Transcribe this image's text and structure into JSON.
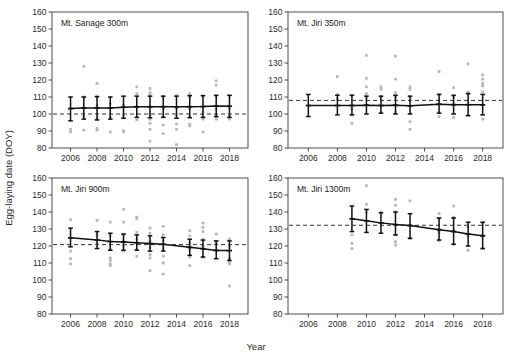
{
  "figure": {
    "xlabel": "Year",
    "ylabel": "Egg-laying date (DOY)"
  },
  "chart_data": {
    "type": "scatter",
    "title": "",
    "xlabel": "Year",
    "ylabel": "Egg-laying date (DOY)",
    "xlim": [
      2004.6,
      2019.4
    ],
    "ylim": [
      80,
      160
    ],
    "xticks": [
      2006,
      2008,
      2010,
      2012,
      2014,
      2016,
      2018
    ],
    "yticks": [
      80,
      90,
      100,
      110,
      120,
      130,
      140,
      150,
      160
    ],
    "grid": false,
    "legend": "none",
    "panel_layout": "2x2",
    "panels": [
      {
        "id": "mt-sanage-300m",
        "label": "Mt. Sanage  300m",
        "row": 0,
        "col": 0,
        "reference_line": 100.0,
        "x": [
          2006,
          2007,
          2008,
          2009,
          2010,
          2011,
          2012,
          2013,
          2014,
          2015,
          2016,
          2017,
          2018
        ],
        "mean": [
          103.2,
          103.6,
          103.5,
          103.6,
          104.0,
          104.2,
          104.2,
          104.3,
          104.2,
          104.3,
          104.4,
          104.7,
          104.6
        ],
        "err_low": [
          96.0,
          97.0,
          96.5,
          97.0,
          97.5,
          98.0,
          97.8,
          98.0,
          97.5,
          97.8,
          98.0,
          98.5,
          98.0
        ],
        "err_high": [
          110.0,
          110.0,
          110.2,
          110.0,
          110.5,
          110.5,
          110.5,
          110.5,
          110.5,
          110.8,
          110.8,
          111.0,
          111.0
        ],
        "points": [
          [
            2006,
            91.0
          ],
          [
            2006,
            89.5
          ],
          [
            2007,
            128.0
          ],
          [
            2007,
            110.0
          ],
          [
            2007,
            99.0
          ],
          [
            2007,
            90.5
          ],
          [
            2008,
            118.0
          ],
          [
            2008,
            110.5
          ],
          [
            2008,
            105.0
          ],
          [
            2008,
            97.5
          ],
          [
            2008,
            91.5
          ],
          [
            2008,
            90.5
          ],
          [
            2009,
            106.0
          ],
          [
            2009,
            98.0
          ],
          [
            2009,
            89.5
          ],
          [
            2010,
            105.0
          ],
          [
            2010,
            99.5
          ],
          [
            2010,
            90.0
          ],
          [
            2010,
            89.5
          ],
          [
            2011,
            116.0
          ],
          [
            2011,
            112.0
          ],
          [
            2011,
            104.5
          ],
          [
            2011,
            96.5
          ],
          [
            2012,
            115.0
          ],
          [
            2012,
            112.5
          ],
          [
            2012,
            111.0
          ],
          [
            2012,
            104.5
          ],
          [
            2012,
            99.5
          ],
          [
            2012,
            97.0
          ],
          [
            2012,
            94.5
          ],
          [
            2012,
            91.0
          ],
          [
            2012,
            84.0
          ],
          [
            2013,
            110.0
          ],
          [
            2013,
            103.0
          ],
          [
            2013,
            98.5
          ],
          [
            2013,
            93.5
          ],
          [
            2013,
            88.5
          ],
          [
            2014,
            111.0
          ],
          [
            2014,
            103.5
          ],
          [
            2014,
            99.5
          ],
          [
            2014,
            94.0
          ],
          [
            2014,
            91.0
          ],
          [
            2014,
            82.0
          ],
          [
            2015,
            112.0
          ],
          [
            2015,
            110.0
          ],
          [
            2015,
            103.0
          ],
          [
            2015,
            98.5
          ],
          [
            2015,
            94.0
          ],
          [
            2015,
            93.0
          ],
          [
            2016,
            110.5
          ],
          [
            2016,
            101.0
          ],
          [
            2016,
            97.0
          ],
          [
            2016,
            89.5
          ],
          [
            2017,
            119.5
          ],
          [
            2017,
            117.0
          ],
          [
            2017,
            110.5
          ],
          [
            2017,
            103.0
          ],
          [
            2017,
            98.5
          ],
          [
            2017,
            97.0
          ],
          [
            2018,
            110.5
          ],
          [
            2018,
            103.5
          ],
          [
            2018,
            99.0
          ],
          [
            2018,
            97.0
          ]
        ]
      },
      {
        "id": "mt-jiri-350m",
        "label": "Mt. Jiri 350m",
        "row": 0,
        "col": 1,
        "reference_line": 108.0,
        "x": [
          2006,
          2008,
          2009,
          2010,
          2011,
          2012,
          2013,
          2015,
          2016,
          2017,
          2018
        ],
        "mean": [
          105.0,
          105.0,
          105.0,
          105.2,
          105.0,
          105.2,
          104.8,
          105.8,
          105.5,
          105.5,
          105.4
        ],
        "err_low": [
          98.5,
          99.5,
          99.5,
          100.0,
          100.5,
          100.0,
          100.0,
          100.5,
          100.0,
          99.0,
          99.5
        ],
        "err_high": [
          111.5,
          111.0,
          111.0,
          110.5,
          110.5,
          111.0,
          110.5,
          111.5,
          111.0,
          112.0,
          111.5
        ],
        "points": [
          [
            2008,
            122.0
          ],
          [
            2008,
            111.5
          ],
          [
            2008,
            109.0
          ],
          [
            2009,
            111.0
          ],
          [
            2009,
            103.0
          ],
          [
            2009,
            99.5
          ],
          [
            2009,
            94.5
          ],
          [
            2010,
            134.5
          ],
          [
            2010,
            121.0
          ],
          [
            2010,
            116.0
          ],
          [
            2010,
            112.0
          ],
          [
            2010,
            110.0
          ],
          [
            2011,
            116.0
          ],
          [
            2011,
            114.5
          ],
          [
            2011,
            110.0
          ],
          [
            2011,
            101.0
          ],
          [
            2012,
            134.0
          ],
          [
            2012,
            120.5
          ],
          [
            2012,
            112.5
          ],
          [
            2012,
            110.0
          ],
          [
            2012,
            101.0
          ],
          [
            2013,
            116.0
          ],
          [
            2013,
            114.5
          ],
          [
            2013,
            110.0
          ],
          [
            2013,
            95.5
          ],
          [
            2013,
            91.0
          ],
          [
            2015,
            125.0
          ],
          [
            2015,
            111.5
          ],
          [
            2015,
            101.0
          ],
          [
            2015,
            98.5
          ],
          [
            2016,
            115.5
          ],
          [
            2016,
            110.0
          ],
          [
            2016,
            98.0
          ],
          [
            2017,
            129.5
          ],
          [
            2017,
            113.0
          ],
          [
            2017,
            112.0
          ],
          [
            2017,
            99.5
          ],
          [
            2018,
            123.0
          ],
          [
            2018,
            120.5
          ],
          [
            2018,
            118.0
          ],
          [
            2018,
            116.5
          ],
          [
            2018,
            113.0
          ],
          [
            2018,
            97.0
          ]
        ]
      },
      {
        "id": "mt-jiri-900m",
        "label": "Mt. Jiri 900m",
        "row": 1,
        "col": 0,
        "reference_line": 120.8,
        "x": [
          2006,
          2008,
          2009,
          2010,
          2011,
          2012,
          2013,
          2015,
          2016,
          2017,
          2018
        ],
        "mean": [
          124.8,
          123.6,
          122.6,
          122.4,
          121.9,
          121.4,
          121.0,
          119.2,
          118.4,
          117.4,
          117.3
        ],
        "err_low": [
          119.5,
          118.5,
          117.5,
          117.5,
          117.5,
          117.0,
          117.0,
          114.5,
          113.5,
          112.5,
          111.5
        ],
        "err_high": [
          130.5,
          128.5,
          127.5,
          127.0,
          126.5,
          126.0,
          125.0,
          124.0,
          123.5,
          123.0,
          123.0
        ],
        "points": [
          [
            2006,
            135.5
          ],
          [
            2006,
            117.0
          ],
          [
            2006,
            112.5
          ],
          [
            2006,
            109.5
          ],
          [
            2008,
            135.0
          ],
          [
            2008,
            126.5
          ],
          [
            2008,
            121.5
          ],
          [
            2009,
            134.0
          ],
          [
            2009,
            126.0
          ],
          [
            2009,
            118.0
          ],
          [
            2009,
            113.0
          ],
          [
            2009,
            111.5
          ],
          [
            2009,
            109.5
          ],
          [
            2009,
            108.5
          ],
          [
            2010,
            141.5
          ],
          [
            2010,
            134.0
          ],
          [
            2010,
            127.0
          ],
          [
            2010,
            123.0
          ],
          [
            2010,
            120.5
          ],
          [
            2010,
            117.0
          ],
          [
            2011,
            137.0
          ],
          [
            2011,
            136.0
          ],
          [
            2011,
            128.0
          ],
          [
            2011,
            124.0
          ],
          [
            2011,
            118.0
          ],
          [
            2011,
            114.0
          ],
          [
            2012,
            130.5
          ],
          [
            2012,
            127.5
          ],
          [
            2012,
            123.0
          ],
          [
            2012,
            119.0
          ],
          [
            2012,
            115.0
          ],
          [
            2012,
            113.0
          ],
          [
            2012,
            105.5
          ],
          [
            2013,
            131.5
          ],
          [
            2013,
            126.5
          ],
          [
            2013,
            123.0
          ],
          [
            2013,
            118.5
          ],
          [
            2013,
            114.0
          ],
          [
            2013,
            110.0
          ],
          [
            2013,
            103.5
          ],
          [
            2015,
            129.0
          ],
          [
            2015,
            126.0
          ],
          [
            2015,
            122.0
          ],
          [
            2015,
            118.0
          ],
          [
            2015,
            113.5
          ],
          [
            2015,
            108.5
          ],
          [
            2016,
            133.5
          ],
          [
            2016,
            131.0
          ],
          [
            2016,
            128.5
          ],
          [
            2016,
            124.0
          ],
          [
            2016,
            120.0
          ],
          [
            2016,
            113.5
          ],
          [
            2017,
            127.0
          ],
          [
            2017,
            122.5
          ],
          [
            2017,
            117.5
          ],
          [
            2018,
            124.0
          ],
          [
            2018,
            120.0
          ],
          [
            2018,
            112.5
          ],
          [
            2018,
            110.5
          ],
          [
            2018,
            109.5
          ],
          [
            2018,
            96.5
          ]
        ]
      },
      {
        "id": "mt-jiri-1300m",
        "label": "Mt. Jiri 1300m",
        "row": 1,
        "col": 1,
        "reference_line": 132.2,
        "x": [
          2009,
          2010,
          2011,
          2012,
          2013,
          2015,
          2016,
          2017,
          2018
        ],
        "mean": [
          136.0,
          134.8,
          133.6,
          132.6,
          132.0,
          129.6,
          128.5,
          127.0,
          126.0
        ],
        "err_low": [
          128.5,
          128.0,
          127.5,
          126.5,
          124.5,
          123.5,
          121.0,
          120.0,
          118.5
        ],
        "err_high": [
          143.5,
          141.5,
          139.5,
          140.0,
          139.0,
          136.5,
          136.5,
          134.0,
          134.0
        ],
        "points": [
          [
            2009,
            126.5
          ],
          [
            2009,
            121.5
          ],
          [
            2009,
            118.5
          ],
          [
            2010,
            155.5
          ],
          [
            2010,
            144.5
          ],
          [
            2010,
            140.0
          ],
          [
            2011,
            140.0
          ],
          [
            2012,
            147.5
          ],
          [
            2012,
            144.0
          ],
          [
            2012,
            140.0
          ],
          [
            2012,
            126.5
          ],
          [
            2012,
            122.5
          ],
          [
            2012,
            120.5
          ],
          [
            2013,
            146.5
          ],
          [
            2013,
            124.5
          ],
          [
            2015,
            139.0
          ],
          [
            2015,
            136.0
          ],
          [
            2015,
            128.0
          ],
          [
            2015,
            123.0
          ],
          [
            2016,
            143.5
          ],
          [
            2016,
            137.0
          ],
          [
            2016,
            136.5
          ],
          [
            2016,
            129.0
          ],
          [
            2016,
            121.0
          ],
          [
            2017,
            131.5
          ],
          [
            2017,
            126.0
          ],
          [
            2017,
            117.5
          ],
          [
            2018,
            133.5
          ],
          [
            2018,
            126.0
          ],
          [
            2018,
            118.5
          ]
        ]
      }
    ]
  }
}
